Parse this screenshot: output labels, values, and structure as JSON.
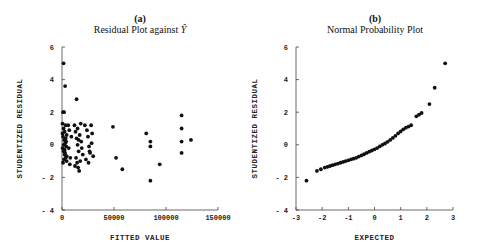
{
  "chart_data": [
    {
      "type": "scatter",
      "panel": "(a)",
      "title": "Residual Plot against Ŷ",
      "xlabel": "FITTED VALUE",
      "ylabel": "STUDENTIZED RESIDUAL",
      "xlim": [
        0,
        150000
      ],
      "ylim": [
        -4,
        6
      ],
      "xticks": [
        0,
        50000,
        100000,
        150000
      ],
      "yticks": [
        -4,
        -2,
        0,
        2,
        4,
        6
      ],
      "grid": false,
      "points": [
        [
          1500,
          5.0
        ],
        [
          3000,
          3.6
        ],
        [
          1000,
          2.0
        ],
        [
          2000,
          2.0
        ],
        [
          14000,
          2.8
        ],
        [
          500,
          1.3
        ],
        [
          1500,
          1.0
        ],
        [
          2500,
          0.8
        ],
        [
          3500,
          1.2
        ],
        [
          4500,
          0.6
        ],
        [
          1000,
          0.5
        ],
        [
          2000,
          0.3
        ],
        [
          3000,
          0.1
        ],
        [
          4000,
          -0.1
        ],
        [
          500,
          -0.2
        ],
        [
          1500,
          -0.4
        ],
        [
          2500,
          -0.6
        ],
        [
          3500,
          -0.8
        ],
        [
          4500,
          -1.0
        ],
        [
          1000,
          -1.1
        ],
        [
          2000,
          -0.9
        ],
        [
          3000,
          -0.5
        ],
        [
          4000,
          0.2
        ],
        [
          500,
          0.7
        ],
        [
          1500,
          0.0
        ],
        [
          2500,
          -0.3
        ],
        [
          3500,
          0.4
        ],
        [
          4500,
          -0.7
        ],
        [
          6000,
          1.2
        ],
        [
          7000,
          0.9
        ],
        [
          6500,
          -0.2
        ],
        [
          8000,
          -0.8
        ],
        [
          9000,
          0.5
        ],
        [
          7500,
          -1.2
        ],
        [
          12000,
          1.2
        ],
        [
          13000,
          0.8
        ],
        [
          14000,
          0.4
        ],
        [
          15000,
          0.0
        ],
        [
          16000,
          -0.4
        ],
        [
          13500,
          -0.8
        ],
        [
          14500,
          -1.1
        ],
        [
          15500,
          -1.4
        ],
        [
          16500,
          -1.6
        ],
        [
          17000,
          0.6
        ],
        [
          18000,
          1.3
        ],
        [
          19000,
          -0.2
        ],
        [
          20000,
          -0.6
        ],
        [
          18500,
          0.2
        ],
        [
          12500,
          -1.3
        ],
        [
          17500,
          -1.0
        ],
        [
          15000,
          1.0
        ],
        [
          16000,
          0.3
        ],
        [
          22000,
          1.2
        ],
        [
          24000,
          0.9
        ],
        [
          25000,
          0.5
        ],
        [
          26000,
          -0.1
        ],
        [
          27000,
          -0.5
        ],
        [
          23000,
          -0.9
        ],
        [
          25500,
          -1.1
        ],
        [
          28000,
          1.2
        ],
        [
          29000,
          0.7
        ],
        [
          30000,
          -0.7
        ],
        [
          28500,
          0.1
        ],
        [
          26500,
          -0.4
        ],
        [
          49000,
          1.1
        ],
        [
          52000,
          -0.8
        ],
        [
          58000,
          -1.5
        ],
        [
          81000,
          0.7
        ],
        [
          85000,
          0.2
        ],
        [
          85000,
          -0.1
        ],
        [
          85000,
          -2.2
        ],
        [
          94000,
          -1.2
        ],
        [
          115000,
          1.8
        ],
        [
          115000,
          1.0
        ],
        [
          115000,
          0.2
        ],
        [
          115000,
          -0.5
        ],
        [
          124000,
          0.3
        ]
      ]
    },
    {
      "type": "scatter",
      "panel": "(b)",
      "title": "Normal Probability Plot",
      "xlabel": "EXPECTED",
      "ylabel": "STUDENTIZED RESIDUAL",
      "xlim": [
        -3,
        3
      ],
      "ylim": [
        -4,
        6
      ],
      "xticks": [
        -3,
        -2,
        -1,
        0,
        1,
        2,
        3
      ],
      "yticks": [
        -4,
        -2,
        0,
        2,
        4,
        6
      ],
      "grid": false,
      "points": [
        [
          -2.6,
          -2.2
        ],
        [
          -2.2,
          -1.6
        ],
        [
          -2.05,
          -1.5
        ],
        [
          -1.9,
          -1.4
        ],
        [
          -1.8,
          -1.35
        ],
        [
          -1.7,
          -1.3
        ],
        [
          -1.6,
          -1.25
        ],
        [
          -1.5,
          -1.2
        ],
        [
          -1.4,
          -1.15
        ],
        [
          -1.3,
          -1.1
        ],
        [
          -1.2,
          -1.05
        ],
        [
          -1.1,
          -1.0
        ],
        [
          -1.0,
          -0.95
        ],
        [
          -0.9,
          -0.9
        ],
        [
          -0.8,
          -0.85
        ],
        [
          -0.7,
          -0.8
        ],
        [
          -0.6,
          -0.72
        ],
        [
          -0.5,
          -0.65
        ],
        [
          -0.4,
          -0.58
        ],
        [
          -0.3,
          -0.5
        ],
        [
          -0.2,
          -0.42
        ],
        [
          -0.1,
          -0.35
        ],
        [
          0.0,
          -0.28
        ],
        [
          0.1,
          -0.2
        ],
        [
          0.2,
          -0.1
        ],
        [
          0.3,
          0.0
        ],
        [
          0.4,
          0.08
        ],
        [
          0.5,
          0.18
        ],
        [
          0.6,
          0.3
        ],
        [
          0.7,
          0.42
        ],
        [
          0.8,
          0.55
        ],
        [
          0.9,
          0.7
        ],
        [
          1.0,
          0.82
        ],
        [
          1.1,
          0.95
        ],
        [
          1.2,
          1.05
        ],
        [
          1.3,
          1.12
        ],
        [
          1.4,
          1.2
        ],
        [
          1.6,
          1.75
        ],
        [
          1.7,
          1.85
        ],
        [
          1.8,
          1.95
        ],
        [
          2.1,
          2.5
        ],
        [
          2.3,
          3.5
        ],
        [
          2.7,
          5.0
        ]
      ]
    }
  ],
  "panels": {
    "a": {
      "letter": "(a)",
      "title": "Residual Plot against",
      "title_symbol": "Ŷ"
    },
    "b": {
      "letter": "(b)",
      "title": "Normal Probability Plot"
    }
  }
}
